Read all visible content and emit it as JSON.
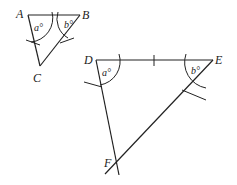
{
  "triangle_abc": {
    "vertices": {
      "A": "A",
      "B": "B",
      "C": "C"
    },
    "angle_labels": {
      "at_A": "a°",
      "at_B": "b°"
    }
  },
  "triangle_def": {
    "vertices": {
      "D": "D",
      "E": "E",
      "F": "F"
    },
    "angle_labels": {
      "at_D": "a°",
      "at_E": "b°"
    }
  }
}
